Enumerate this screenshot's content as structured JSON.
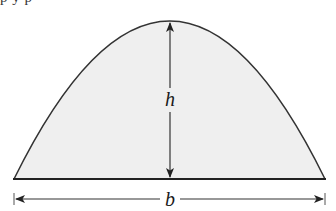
{
  "figure": {
    "clipped_top_text": "p        y      p",
    "shape": "parabolic-arch",
    "labels": {
      "height": "h",
      "base": "b"
    },
    "colors": {
      "fill": "#efefef",
      "stroke": "#333333",
      "background": "#ffffff"
    },
    "geometry": {
      "apex": [
        170,
        21
      ],
      "base_left": [
        14,
        179
      ],
      "base_right": [
        325,
        179
      ],
      "height_arrow_x": 170,
      "base_dimension_y": 199
    }
  }
}
